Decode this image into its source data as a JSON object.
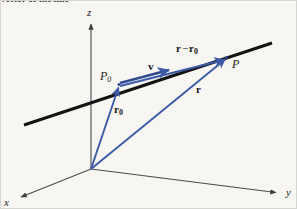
{
  "figure": {
    "domain": "Diagram",
    "width": 297,
    "height": 209,
    "background_color": "#f7f6f3",
    "border_color": "#d8d6d2",
    "caption_clipped": "vector of the line"
  },
  "colors": {
    "axis": "#4a4a4a",
    "line": "#141414",
    "vector_blue": "#3b5ba8",
    "vector_blue_dark": "#2f4a92",
    "text": "#1c1c1c"
  },
  "axes": {
    "origin": {
      "x": 90,
      "y": 168
    },
    "items": [
      {
        "name": "z",
        "label": "z",
        "from": {
          "x": 90,
          "y": 168
        },
        "to": {
          "x": 90,
          "y": 21
        },
        "label_pos": {
          "x": 86,
          "y": 6
        }
      },
      {
        "name": "x",
        "label": "x",
        "from": {
          "x": 90,
          "y": 168
        },
        "to": {
          "x": 18,
          "y": 197
        },
        "label_pos": {
          "x": 3,
          "y": 197
        }
      },
      {
        "name": "y",
        "label": "y",
        "from": {
          "x": 90,
          "y": 168
        },
        "to": {
          "x": 277,
          "y": 192
        },
        "label_pos": {
          "x": 285,
          "y": 187
        }
      }
    ]
  },
  "line": {
    "name": "the-line",
    "from": {
      "x": 23,
      "y": 124
    },
    "to": {
      "x": 271,
      "y": 42
    },
    "width": 3
  },
  "points": [
    {
      "name": "P0",
      "label": "P",
      "sub": "0",
      "pos": {
        "x": 117,
        "y": 83
      },
      "label_pos": {
        "x": 99,
        "y": 70
      }
    },
    {
      "name": "P",
      "label": "P",
      "sub": "",
      "pos": {
        "x": 226,
        "y": 56
      },
      "label_pos": {
        "x": 231,
        "y": 57
      }
    }
  ],
  "vectors": [
    {
      "name": "r0",
      "label": "r",
      "sub": "0",
      "op": "",
      "label2": "",
      "sub2": "",
      "from": {
        "x": 90,
        "y": 168
      },
      "to": {
        "x": 117,
        "y": 83
      },
      "label_pos": {
        "x": 113,
        "y": 104
      }
    },
    {
      "name": "r",
      "label": "r",
      "sub": "",
      "op": "",
      "label2": "",
      "sub2": "",
      "from": {
        "x": 90,
        "y": 168
      },
      "to": {
        "x": 226,
        "y": 56
      },
      "label_pos": {
        "x": 195,
        "y": 84
      }
    },
    {
      "name": "v",
      "label": "v",
      "sub": "",
      "op": "",
      "label2": "",
      "sub2": "",
      "from": {
        "x": 118,
        "y": 84
      },
      "to": {
        "x": 170,
        "y": 67
      },
      "label_pos": {
        "x": 147,
        "y": 60
      }
    },
    {
      "name": "r-minus-r0",
      "label": "r",
      "sub": "",
      "op": "−",
      "label2": "r",
      "sub2": "0",
      "from": {
        "x": 118,
        "y": 84
      },
      "to": {
        "x": 226,
        "y": 56
      },
      "label_pos": {
        "x": 175,
        "y": 42
      }
    }
  ],
  "legend": {
    "description": "A straight black line passes through point P0 and point P. The blue position vector r0 runs from the origin to P0, the blue position vector r runs from the origin to P, the blue direction vector v lies along the line starting at P0, and the blue vector r − r0 runs from P0 to P."
  }
}
